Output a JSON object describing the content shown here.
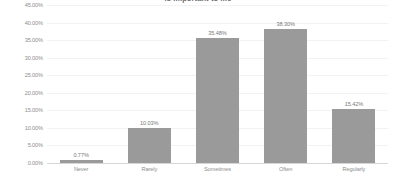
{
  "chart_data": {
    "type": "bar",
    "title": "is important to me",
    "xlabel": "",
    "ylabel": "",
    "categories": [
      "Never",
      "Rarely",
      "Sometimes",
      "Often",
      "Regularly"
    ],
    "values": [
      0.77,
      10.03,
      35.48,
      38.3,
      15.42
    ],
    "value_labels": [
      "0.77%",
      "10.03%",
      "35.48%",
      "38.30%",
      "15.42%"
    ],
    "ylim": [
      0,
      45
    ],
    "ytick_values": [
      0,
      5,
      10,
      15,
      20,
      25,
      30,
      35,
      40,
      45
    ],
    "ytick_labels": [
      "0.00%",
      "5.00%",
      "10.00%",
      "15.00%",
      "20.00%",
      "25.00%",
      "30.00%",
      "35.00%",
      "40.00%",
      "45.00%"
    ],
    "grid": true,
    "legend": false,
    "bar_color": "#9a9a9a",
    "text_color": "#8d8d8d",
    "background": "#ffffff"
  }
}
